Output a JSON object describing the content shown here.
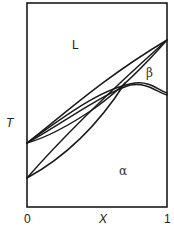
{
  "diagram": {
    "axes": {
      "y_label": "T",
      "x_label": "X",
      "x_ticks": [
        "0",
        "1"
      ]
    },
    "regions": {
      "liquid": "L",
      "beta": "β",
      "alpha": "α"
    },
    "colors": {
      "line": "#1a1a1a",
      "background": "#ffffff"
    }
  }
}
